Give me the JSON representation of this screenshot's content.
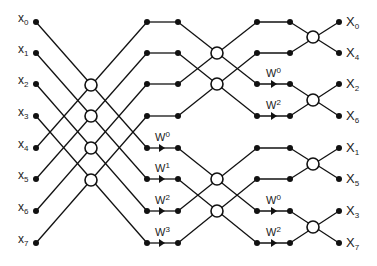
{
  "diagram": {
    "title": "",
    "type": "radix-2 FFT butterfly signal-flow graph",
    "inputs": [
      "x0",
      "x1",
      "x2",
      "x3",
      "x4",
      "x5",
      "x6",
      "x7"
    ],
    "outputs": [
      "X0",
      "X4",
      "X2",
      "X6",
      "X1",
      "X5",
      "X3",
      "X7"
    ],
    "input_labels": [
      {
        "base": "x",
        "sub": "0"
      },
      {
        "base": "x",
        "sub": "1"
      },
      {
        "base": "x",
        "sub": "2"
      },
      {
        "base": "x",
        "sub": "3"
      },
      {
        "base": "x",
        "sub": "4"
      },
      {
        "base": "x",
        "sub": "5"
      },
      {
        "base": "x",
        "sub": "6"
      },
      {
        "base": "x",
        "sub": "7"
      }
    ],
    "output_labels": [
      {
        "base": "X",
        "sub": "0"
      },
      {
        "base": "X",
        "sub": "4"
      },
      {
        "base": "X",
        "sub": "2"
      },
      {
        "base": "X",
        "sub": "6"
      },
      {
        "base": "X",
        "sub": "1"
      },
      {
        "base": "X",
        "sub": "5"
      },
      {
        "base": "X",
        "sub": "3"
      },
      {
        "base": "X",
        "sub": "7"
      }
    ],
    "stage1_twiddles": [
      {
        "base": "W",
        "sup": "0"
      },
      {
        "base": "W",
        "sup": "1"
      },
      {
        "base": "W",
        "sup": "2"
      },
      {
        "base": "W",
        "sup": "3"
      }
    ],
    "stage2_twiddles": [
      {
        "base": "W",
        "sup": "0"
      },
      {
        "base": "W",
        "sup": "2"
      },
      {
        "base": "W",
        "sup": "0"
      },
      {
        "base": "W",
        "sup": "2"
      }
    ],
    "colors": {
      "line": "#111111",
      "background": "#ffffff"
    }
  }
}
